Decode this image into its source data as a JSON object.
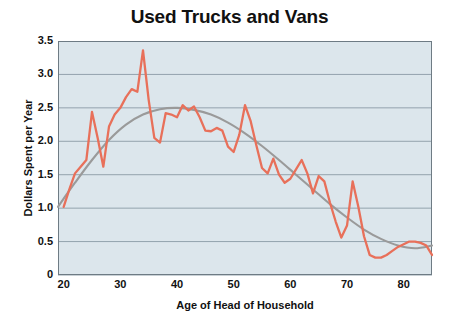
{
  "chart_data": {
    "type": "line",
    "title": "Used Trucks and Vans",
    "xlabel": "Age of Head of Household",
    "ylabel": "Dollars Spent per Year",
    "xlim": [
      19,
      85
    ],
    "ylim": [
      0,
      3.5
    ],
    "grid": true,
    "legend": "none",
    "xticks": [
      20,
      30,
      40,
      50,
      60,
      70,
      80
    ],
    "xtick_labels": [
      "20",
      "30",
      "40",
      "50",
      "60",
      "70",
      "80"
    ],
    "yticks": [
      0,
      0.5,
      1.0,
      1.5,
      2.0,
      2.5,
      3.0,
      3.5
    ],
    "ytick_labels": [
      "0",
      "0.5",
      "1.0",
      "1.5",
      "2.0",
      "2.5",
      "3.0",
      "3.5"
    ],
    "colors": {
      "data_line": "#E8705A",
      "trend_line": "#9A9A9A",
      "plot_background": "#DCE6EC",
      "gridline": "#93A3AD",
      "axis": "#6E7B84",
      "text": "#111111",
      "page_background": "#FFFFFF"
    },
    "series": [
      {
        "name": "Dollars Spent per Year",
        "kind": "data",
        "color": "#E8705A",
        "x": [
          20,
          21,
          22,
          23,
          24,
          25,
          26,
          27,
          28,
          29,
          30,
          31,
          32,
          33,
          34,
          35,
          36,
          37,
          38,
          39,
          40,
          41,
          42,
          43,
          44,
          45,
          46,
          47,
          48,
          49,
          50,
          51,
          52,
          53,
          54,
          55,
          56,
          57,
          58,
          59,
          60,
          61,
          62,
          63,
          64,
          65,
          66,
          67,
          68,
          69,
          70,
          71,
          72,
          73,
          74,
          75,
          76,
          77,
          78,
          79,
          80,
          81,
          82,
          83,
          84,
          85
        ],
        "y": [
          1.02,
          1.28,
          1.52,
          1.62,
          1.72,
          2.44,
          2.05,
          1.62,
          2.22,
          2.4,
          2.5,
          2.66,
          2.78,
          2.74,
          3.36,
          2.62,
          2.05,
          1.98,
          2.42,
          2.4,
          2.36,
          2.54,
          2.46,
          2.52,
          2.36,
          2.16,
          2.15,
          2.2,
          2.16,
          1.92,
          1.84,
          2.1,
          2.54,
          2.3,
          1.94,
          1.6,
          1.52,
          1.74,
          1.5,
          1.38,
          1.44,
          1.58,
          1.72,
          1.52,
          1.22,
          1.48,
          1.4,
          1.08,
          0.8,
          0.56,
          0.74,
          1.4,
          1.02,
          0.58,
          0.3,
          0.26,
          0.26,
          0.3,
          0.36,
          0.42,
          0.46,
          0.5,
          0.5,
          0.48,
          0.44,
          0.3
        ]
      },
      {
        "name": "Trend",
        "kind": "trend",
        "color": "#9A9A9A",
        "x": [
          19,
          22,
          25,
          28,
          31,
          34,
          37,
          40,
          43,
          46,
          49,
          52,
          55,
          58,
          61,
          64,
          67,
          70,
          73,
          76,
          79,
          82,
          85
        ],
        "y": [
          1.02,
          1.38,
          1.72,
          2.02,
          2.25,
          2.4,
          2.48,
          2.5,
          2.47,
          2.4,
          2.28,
          2.12,
          1.93,
          1.72,
          1.5,
          1.28,
          1.06,
          0.86,
          0.68,
          0.54,
          0.44,
          0.4,
          0.44
        ]
      }
    ]
  }
}
